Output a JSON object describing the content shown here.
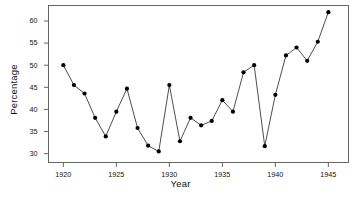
{
  "chart_data": {
    "type": "line",
    "title": "",
    "xlabel": "Year",
    "ylabel": "Percentage",
    "x": [
      1920,
      1921,
      1922,
      1923,
      1924,
      1925,
      1926,
      1927,
      1928,
      1929,
      1930,
      1931,
      1932,
      1933,
      1934,
      1935,
      1936,
      1937,
      1938,
      1939,
      1940,
      1941,
      1942,
      1943,
      1944,
      1945
    ],
    "values": [
      50.0,
      45.5,
      43.6,
      38.1,
      33.9,
      39.5,
      44.7,
      35.8,
      31.8,
      30.5,
      45.5,
      32.8,
      38.1,
      36.4,
      37.4,
      42.1,
      39.5,
      48.4,
      50.0,
      31.7,
      43.3,
      52.2,
      54.0,
      51.0,
      55.3,
      62.0
    ],
    "series": [
      {
        "name": "Percentage",
        "values": [
          50.0,
          45.5,
          43.6,
          38.1,
          33.9,
          39.5,
          44.7,
          35.8,
          31.8,
          30.5,
          45.5,
          32.8,
          38.1,
          36.4,
          37.4,
          42.1,
          39.5,
          48.4,
          50.0,
          31.7,
          43.3,
          52.2,
          54.0,
          51.0,
          55.3,
          62.0
        ]
      }
    ],
    "xlim": [
      1918.6,
      1946.9
    ],
    "ylim": [
      28.0,
      63.5
    ],
    "xticks": [
      1920,
      1925,
      1930,
      1935,
      1940,
      1945
    ],
    "xtick_labels": [
      "1920",
      "1925",
      "1930",
      "1935",
      "1940",
      "1945"
    ],
    "yticks": [
      30,
      35,
      40,
      45,
      50,
      55,
      60
    ],
    "ytick_labels": [
      "30",
      "35",
      "40",
      "45",
      "50",
      "55",
      "60"
    ],
    "grid": false,
    "legend": null,
    "marker": "filled-circle",
    "line_color": "#3a3a3a",
    "marker_color": "#000000",
    "frame_color": "#555555",
    "background": "#ffffff"
  }
}
